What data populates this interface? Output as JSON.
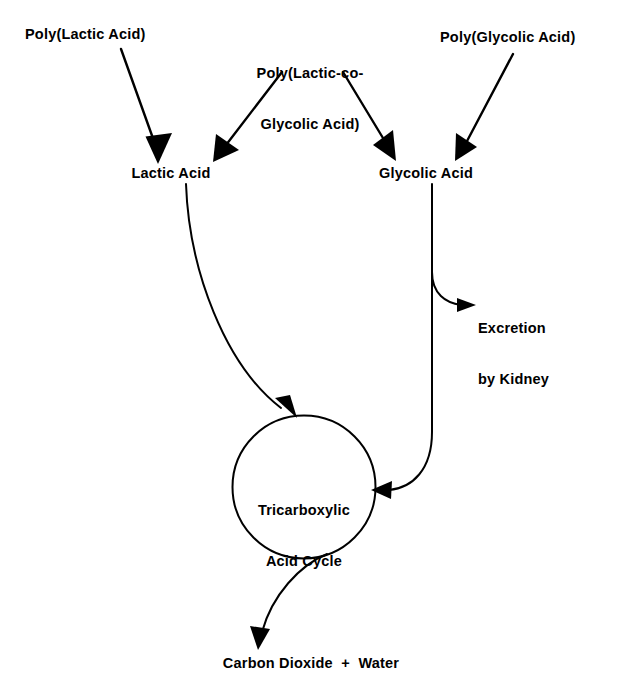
{
  "figure": {
    "kind": "flow-diagram",
    "background_color": "#ffffff",
    "stroke_color": "#000000",
    "text_color": "#000000"
  },
  "nodes": {
    "poly_lactic_acid": {
      "label": "Poly(Lactic Acid)"
    },
    "poly_lactic_co_glycolic_acid": {
      "line1": "Poly(Lactic-co-",
      "line2": "Glycolic Acid)"
    },
    "poly_glycolic_acid": {
      "label": "Poly(Glycolic Acid)"
    },
    "lactic_acid": {
      "label": "Lactic Acid"
    },
    "glycolic_acid": {
      "label": "Glycolic Acid"
    },
    "excretion": {
      "line1": "Excretion",
      "line2": "by Kidney"
    },
    "tricarboxylic_acid_cycle": {
      "line1": "Tricarboxylic",
      "line2": "Acid Cycle"
    },
    "carbon_dioxide_water": {
      "label": "Carbon Dioxide  +  Water"
    }
  },
  "edges": [
    {
      "name": "pla-to-lactic-acid",
      "from": "poly_lactic_acid",
      "to": "lactic_acid",
      "style": "straight-arrow"
    },
    {
      "name": "plga-to-lactic-acid",
      "from": "poly_lactic_co_glycolic_acid",
      "to": "lactic_acid",
      "style": "straight-arrow"
    },
    {
      "name": "plga-to-glycolic-acid",
      "from": "poly_lactic_co_glycolic_acid",
      "to": "glycolic_acid",
      "style": "straight-arrow"
    },
    {
      "name": "pga-to-glycolic-acid",
      "from": "poly_glycolic_acid",
      "to": "glycolic_acid",
      "style": "straight-arrow"
    },
    {
      "name": "lactic-acid-to-tca",
      "from": "lactic_acid",
      "to": "tricarboxylic_acid_cycle",
      "style": "curved-arrow"
    },
    {
      "name": "glycolic-acid-to-excretion",
      "from": "glycolic_acid",
      "to": "excretion",
      "style": "curved-branch-arrow"
    },
    {
      "name": "glycolic-acid-to-tca",
      "from": "glycolic_acid",
      "to": "tricarboxylic_acid_cycle",
      "style": "curved-arrow"
    },
    {
      "name": "tca-to-carbon-dioxide-water",
      "from": "tricarboxylic_acid_cycle",
      "to": "carbon_dioxide_water",
      "style": "curved-arrow"
    }
  ]
}
